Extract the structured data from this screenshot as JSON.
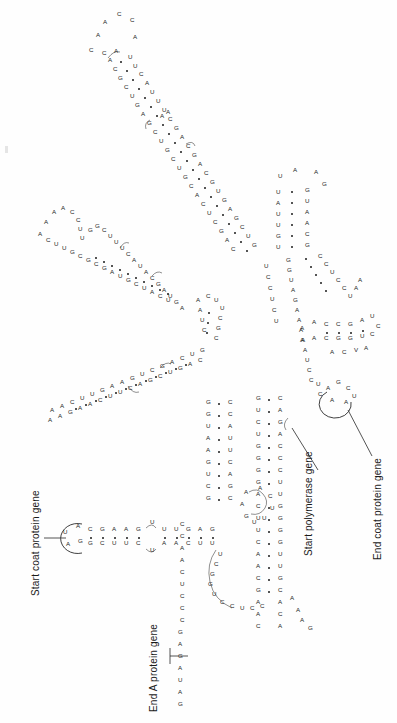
{
  "figure": {
    "type": "rna-secondary-structure",
    "orientation_degrees": -90,
    "background_color": "#ffffff",
    "ink_color": "#1b1b1b",
    "nucleotide_alphabet": [
      "A",
      "U",
      "G",
      "C"
    ],
    "pair_symbol": "dot"
  },
  "annotations": [
    {
      "id": "start-coat-protein-gene",
      "text": "Start coat protein gene",
      "x": 30,
      "y": 596,
      "rotated": true,
      "leader": true
    },
    {
      "id": "end-a-protein-gene",
      "text": "End A protein gene",
      "x": 148,
      "y": 712,
      "rotated": true,
      "leader": true
    },
    {
      "id": "start-polymerase-gene",
      "text": "Start polymerase gene",
      "x": 303,
      "y": 556,
      "rotated": true,
      "leader": true
    },
    {
      "id": "end-coat-protein-gene",
      "text": "End coat protein gene",
      "x": 372,
      "y": 560,
      "rotated": true,
      "leader": true
    }
  ],
  "sequences": {
    "five_prime_tail": "GAUAGAGCCCUCAACC",
    "coat_start_loop": "A G U A",
    "coat_start_stem_left": "C G A A G G A G",
    "coat_start_stem_right": "G C U U C C U C",
    "internal_loop_bases": "U U U",
    "polymerase_stem_left": "C A A G C A A C U U C G G C G G G C C G U U C G U C G A C U C A",
    "polymerase_stem_right": "A C A C A G A A G C U G A C C G C C U G G C C A A G G C G G U G",
    "loop_bases_lower": "A A A G",
    "hairpin_upper": "U A U U G U / G U A A C G",
    "branch_sequence": "G G U A G A A A A U C C U C U",
    "junction_run": "C U G G U C C U C C"
  },
  "legend": {
    "pair_dot_meaning": "base pair",
    "letters_meaning": "nucleotide"
  }
}
